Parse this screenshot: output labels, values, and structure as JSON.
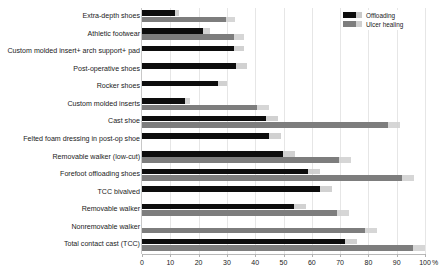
{
  "chart_data": {
    "type": "bar",
    "orientation": "horizontal",
    "title": "",
    "xlabel": "%",
    "ylabel": "",
    "xlim": [
      0,
      100
    ],
    "xticks": [
      0,
      10,
      20,
      30,
      40,
      50,
      60,
      70,
      80,
      90,
      100
    ],
    "xticklabels": [
      "0",
      "10",
      "20",
      "30",
      "40",
      "50",
      "60",
      "70",
      "80",
      "90",
      "100"
    ],
    "grid": true,
    "legend_position": "top-right",
    "legend": [
      "Offloading",
      "Ulcer healing"
    ],
    "categories": [
      "Extra-depth shoes",
      "Athletic footwear",
      "Custom molded insert+ arch support+ pad",
      "Post-operative shoes",
      "Rocker shoes",
      "Custom molded inserts",
      "Cast shoe",
      "Felted foam dressing in post-op shoe",
      "Removable walker (low-cut)",
      "Forefoot offloading shoes",
      "TCC bivalved",
      "Removable walker",
      "Nonremovable walker",
      "Total contact cast (TCC)"
    ],
    "series": [
      {
        "name": "Offloading",
        "color": "#0d0d0d",
        "values": [
          13,
          24,
          36,
          37,
          30,
          17,
          48,
          49,
          54,
          63,
          67,
          58,
          0,
          76
        ]
      },
      {
        "name": "Ulcer healing",
        "color": "#7d7d7d",
        "values": [
          33,
          36,
          0,
          0,
          0,
          45,
          91,
          0,
          74,
          96,
          0,
          73,
          83,
          100
        ]
      }
    ]
  },
  "legend": {
    "items": [
      {
        "label": "Offloading",
        "color": "#0d0d0d"
      },
      {
        "label": "Ulcer healing",
        "color": "#7d7d7d"
      }
    ]
  },
  "axis": {
    "unit": "%",
    "ticks": [
      "0",
      "10",
      "20",
      "30",
      "40",
      "50",
      "60",
      "70",
      "80",
      "90",
      "100"
    ]
  }
}
